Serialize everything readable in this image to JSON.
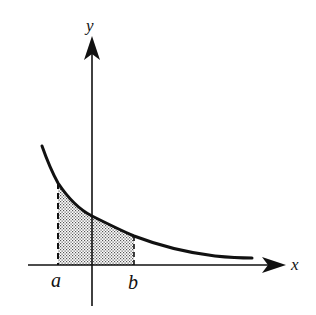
{
  "figure": {
    "colors": {
      "stroke": "#111111",
      "background": "#ffffff",
      "shade_dot": "#555555"
    },
    "axes": {
      "x_label": "x",
      "y_label": "y"
    },
    "bounds": {
      "a_label": "a",
      "b_label": "b"
    },
    "curve": {
      "type": "decreasing exponential",
      "shaded_region": "between x=a and x=b under curve"
    }
  }
}
